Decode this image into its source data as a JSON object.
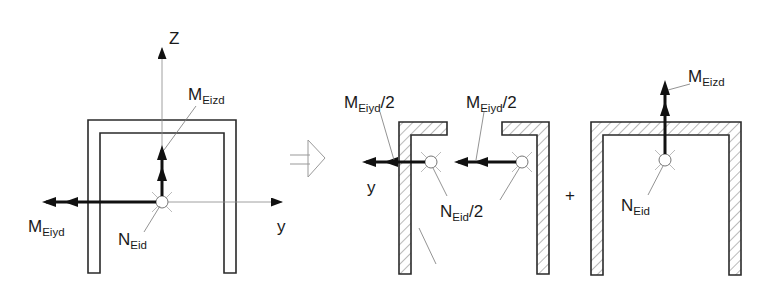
{
  "figure": {
    "colors": {
      "line": "#2a2a2a",
      "force": "#111111",
      "leader": "#777777",
      "background": "#ffffff"
    }
  },
  "left_section": {
    "axis_z_label": "Z",
    "axis_y_label": "y",
    "moment_y": {
      "base": "M",
      "sub": "Eiyd"
    },
    "moment_z": {
      "base": "M",
      "sub": "Eizd"
    },
    "axial": {
      "base": "N",
      "sub": "Eid"
    }
  },
  "transform_symbol": "implies-arrow",
  "middle_left_half": {
    "moment_y": {
      "base": "M",
      "sub": "Eiyd",
      "suffix": "/2"
    },
    "axis_y_label": "y"
  },
  "middle_right_half": {
    "moment_y": {
      "base": "M",
      "sub": "Eiyd",
      "suffix": "/2"
    },
    "axial": {
      "base": "N",
      "sub": "Eid",
      "suffix": "/2"
    }
  },
  "plus_sign": "+",
  "right_section": {
    "moment_z": {
      "base": "M",
      "sub": "Eizd"
    },
    "axial": {
      "base": "N",
      "sub": "Eid"
    }
  }
}
